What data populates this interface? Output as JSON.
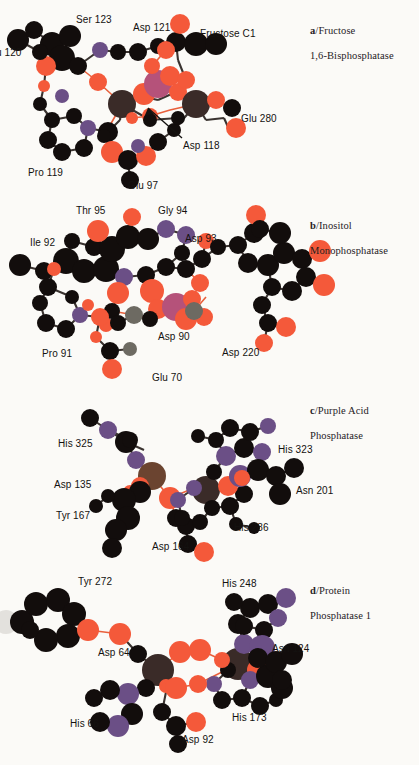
{
  "figure": {
    "background_color": "#fbfaf7",
    "atom_colors": {
      "carbon": "#120d0c",
      "oxygen": "#f4593a",
      "nitrogen": "#6b4f86",
      "metal_magenta": "#b5527a",
      "metal_brown": "#6b4430",
      "metal_dark": "#3a2b28",
      "metal_gray": "#6d6a62",
      "bond": "#3a3330",
      "bond_coordination": "#e8603c",
      "ghost": "#e3e1dd"
    }
  },
  "panels": [
    {
      "id": "a",
      "letter": "a",
      "title_line1": "/Fructose",
      "title_line2": "1,6-Bisphosphatase",
      "title_full": "a/Fructose 1,6-Bisphosphatase",
      "labels": [
        {
          "text": "Ser 123",
          "x": 76,
          "y": 14
        },
        {
          "text": "Asp 121",
          "x": 133,
          "y": 22
        },
        {
          "text": "Fructose C1",
          "x": 200,
          "y": 28
        },
        {
          "text": "u 120",
          "x": -4,
          "y": 47
        },
        {
          "text": "Glu 280",
          "x": 241,
          "y": 113
        },
        {
          "text": "Asp 118",
          "x": 183,
          "y": 140
        },
        {
          "text": "Pro 119",
          "x": 28,
          "y": 167
        },
        {
          "text": "Glu 97",
          "x": 128,
          "y": 180
        }
      ]
    },
    {
      "id": "b",
      "letter": "b",
      "title_line1": "/Inositol",
      "title_line2": "Monophosphatase",
      "title_full": "b/Inositol Monophosphatase",
      "labels": [
        {
          "text": "Thr 95",
          "x": 76,
          "y": 10
        },
        {
          "text": "Gly 94",
          "x": 158,
          "y": 10
        },
        {
          "text": "Ile 92",
          "x": 30,
          "y": 42
        },
        {
          "text": "Asp 93",
          "x": 185,
          "y": 38
        },
        {
          "text": "Asp 90",
          "x": 158,
          "y": 136
        },
        {
          "text": "Asp 220",
          "x": 222,
          "y": 152
        },
        {
          "text": "Pro 91",
          "x": 42,
          "y": 153
        },
        {
          "text": "Glu 70",
          "x": 152,
          "y": 177
        }
      ]
    },
    {
      "id": "c",
      "letter": "c",
      "title_line1": "/Purple Acid",
      "title_line2": "Phosphatase",
      "title_full": "c/Purple Acid Phosphatase",
      "labels": [
        {
          "text": "His 325",
          "x": 58,
          "y": 60
        },
        {
          "text": "His 323",
          "x": 278,
          "y": 66
        },
        {
          "text": "Asp 135",
          "x": 54,
          "y": 101
        },
        {
          "text": "Asn 201",
          "x": 296,
          "y": 107
        },
        {
          "text": "Tyr 167",
          "x": 56,
          "y": 132
        },
        {
          "text": "His 286",
          "x": 234,
          "y": 144
        },
        {
          "text": "Asp 164",
          "x": 152,
          "y": 163
        }
      ]
    },
    {
      "id": "d",
      "letter": "d",
      "title_line1": "/Protein",
      "title_line2": "Phosphatase 1",
      "title_full": "d/Protein Phosphatase 1",
      "labels": [
        {
          "text": "Tyr 272",
          "x": 78,
          "y": 16
        },
        {
          "text": "His 248",
          "x": 222,
          "y": 18
        },
        {
          "text": "Asp 64",
          "x": 98,
          "y": 87
        },
        {
          "text": "Asn 124",
          "x": 272,
          "y": 83
        },
        {
          "text": "His 66",
          "x": 70,
          "y": 158
        },
        {
          "text": "Asp 92",
          "x": 182,
          "y": 174
        },
        {
          "text": "His 173",
          "x": 232,
          "y": 152
        }
      ]
    }
  ],
  "panel_title_position": {
    "x": 310,
    "y_a": 12,
    "y_b": 12,
    "y_c": 14,
    "y_d": 12
  }
}
